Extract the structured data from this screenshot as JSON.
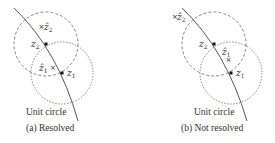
{
  "panels": [
    {
      "id": "a",
      "caption": "(a) Resolved",
      "arc_label": "Unit circle",
      "points": {
        "z1": {
          "label": "z",
          "sub": "1"
        },
        "z2": {
          "label": "z",
          "sub": "2"
        },
        "z1_hat": {
          "label": "ẑ",
          "sub": "1"
        },
        "z2_hat": {
          "label": "ẑ",
          "sub": "2"
        }
      }
    },
    {
      "id": "b",
      "caption": "(b) Not resolved",
      "arc_label": "Unit circle",
      "points": {
        "z1": {
          "label": "z",
          "sub": "1"
        },
        "z2": {
          "label": "z",
          "sub": "2"
        },
        "z1_hat": {
          "label": "ẑ",
          "sub": "1"
        },
        "z2_hat": {
          "label": "ẑ",
          "sub": "2"
        }
      }
    }
  ],
  "colors": {
    "stroke": "#444444",
    "text": "#333333"
  }
}
